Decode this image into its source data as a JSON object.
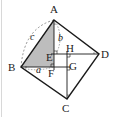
{
  "figure": {
    "colors": {
      "stroke": "#1a1a1a",
      "shaded": "#bdbdbd",
      "dashed": "#777777",
      "border": "#d8d8d8"
    },
    "points": {
      "A": {
        "label": "A",
        "x": 54,
        "y": 20
      },
      "B": {
        "label": "B",
        "x": 21,
        "y": 67
      },
      "C": {
        "label": "C",
        "x": 67,
        "y": 99
      },
      "D": {
        "label": "D",
        "x": 99,
        "y": 54
      },
      "E": {
        "label": "E",
        "x": 54,
        "y": 54
      },
      "F": {
        "label": "F",
        "x": 54,
        "y": 67
      },
      "G": {
        "label": "G",
        "x": 67,
        "y": 67
      },
      "H": {
        "label": "H",
        "x": 67,
        "y": 54
      }
    },
    "side_labels": {
      "a": "a",
      "b": "b",
      "c": "c"
    },
    "shaded_triangle": [
      "A",
      "B",
      "F"
    ]
  }
}
